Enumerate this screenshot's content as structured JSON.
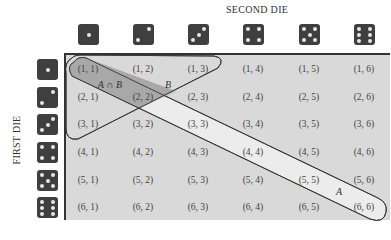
{
  "axes": {
    "column_header": "SECOND DIE",
    "row_header": "FIRST DIE"
  },
  "dice_faces": [
    1,
    2,
    3,
    4,
    5,
    6
  ],
  "cells": [
    [
      "(1, 1)",
      "(1, 2)",
      "(1, 3)",
      "(1, 4)",
      "(1, 5)",
      "(1, 6)"
    ],
    [
      "(2, 1)",
      "(2, 2)",
      "(2, 3)",
      "(2, 4)",
      "(2, 5)",
      "(2, 6)"
    ],
    [
      "(3, 1)",
      "(3, 2)",
      "(3, 3)",
      "(3, 4)",
      "(3, 5)",
      "(3, 6)"
    ],
    [
      "(4, 1)",
      "(4, 2)",
      "(4, 3)",
      "(4, 4)",
      "(4, 5)",
      "(4, 6)"
    ],
    [
      "(5, 1)",
      "(5, 2)",
      "(5, 3)",
      "(5, 4)",
      "(5, 5)",
      "(5, 6)"
    ],
    [
      "(6, 1)",
      "(6, 2)",
      "(6, 3)",
      "(6, 4)",
      "(6, 5)",
      "(6, 6)"
    ]
  ],
  "regions": {
    "A": {
      "label": "A",
      "description": "diagonal outcomes (i, i)"
    },
    "B": {
      "label": "B",
      "description": "outcomes with sum ≤ 4"
    },
    "intersection": {
      "label": "A ∩ B"
    }
  },
  "colors": {
    "grid_background": "#d9d9d9",
    "region_A_fill": "#ececec",
    "intersection_fill": "#a8a8a8",
    "die_body": "#3f3f3f",
    "die_pip": "#e6e6e6",
    "outline": "#333333"
  }
}
